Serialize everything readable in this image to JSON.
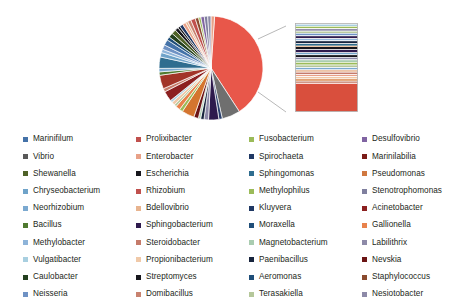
{
  "chart_data": {
    "type": "pie",
    "title": "",
    "subtitle": "",
    "xlabel": "",
    "ylabel": "",
    "legend_position": "bottom",
    "grid": false,
    "has_magnified_inset": true,
    "inset_type": "stacked-bar",
    "inset_description": "Magnified stacked bar expanding the dominant Prolixibacter slice and adjacent thin slices",
    "categories": [
      "Marinifilum",
      "Prolixibacter",
      "Fusobacterium",
      "Desulfovibrio",
      "Vibrio",
      "Enterobacter",
      "Spirochaeta",
      "Marinilabilia",
      "Shewanella",
      "Escherichia",
      "Sphingomonas",
      "Pseudomonas",
      "Chryseobacterium",
      "Rhizobium",
      "Methylophilus",
      "Stenotrophomonas",
      "Neorhizobium",
      "Bdellovibrio",
      "Kluyvera",
      "Acinetobacter",
      "Bacillus",
      "Sphingobacterium",
      "Moraxella",
      "Gallionella",
      "Methylobacter",
      "Steroidobacter",
      "Magnetobacterium",
      "Labilithrix",
      "Vulgatibacter",
      "Propionibacterium",
      "Paenibacillus",
      "Nevskia",
      "Caulobacter",
      "Streptomyces",
      "Aeromonas",
      "Staphylococcus",
      "Neisseria",
      "Domibacillus",
      "Terasakiella",
      "Nesiotobacter"
    ],
    "values": [
      2.4,
      36.0,
      1.0,
      1.2,
      2.0,
      1.3,
      1.1,
      3.6,
      1.8,
      1.0,
      1.5,
      2.6,
      1.4,
      3.2,
      1.2,
      1.1,
      1.3,
      1.6,
      0.9,
      2.2,
      1.5,
      1.0,
      1.1,
      1.4,
      1.2,
      1.3,
      1.0,
      0.9,
      1.1,
      1.6,
      1.0,
      0.9,
      0.8,
      1.0,
      1.1,
      0.9,
      1.0,
      1.2,
      0.9,
      1.4
    ],
    "units": "percent relative abundance"
  },
  "legend": {
    "columns": 4,
    "rows": 10,
    "items": [
      {
        "label": "Marinifilum",
        "color": "#4472a8"
      },
      {
        "label": "Prolixibacter",
        "color": "#c0504d"
      },
      {
        "label": "Fusobacterium",
        "color": "#9bbb59"
      },
      {
        "label": "Desulfovibrio",
        "color": "#8064a2"
      },
      {
        "label": "Vibrio",
        "color": "#595959"
      },
      {
        "label": "Enterobacter",
        "color": "#e8a188"
      },
      {
        "label": "Spirochaeta",
        "color": "#1f3864"
      },
      {
        "label": "Marinilabilia",
        "color": "#7b1c18"
      },
      {
        "label": "Shewanella",
        "color": "#4f6228"
      },
      {
        "label": "Escherichia",
        "color": "#17161c"
      },
      {
        "label": "Sphingomonas",
        "color": "#2f6d8f"
      },
      {
        "label": "Pseudomonas",
        "color": "#d07840"
      },
      {
        "label": "Chryseobacterium",
        "color": "#6fa3c9"
      },
      {
        "label": "Rhizobium",
        "color": "#c0504d"
      },
      {
        "label": "Methylophilus",
        "color": "#9bbb59"
      },
      {
        "label": "Stenotrophomonas",
        "color": "#7f7f9e"
      },
      {
        "label": "Neorhizobium",
        "color": "#7ba9d0"
      },
      {
        "label": "Bdellovibrio",
        "color": "#e8b48f"
      },
      {
        "label": "Kluyvera",
        "color": "#1f3864"
      },
      {
        "label": "Acinetobacter",
        "color": "#8c2020"
      },
      {
        "label": "Bacillus",
        "color": "#4f7a2f"
      },
      {
        "label": "Sphingobacterium",
        "color": "#2e1a4d"
      },
      {
        "label": "Moraxella",
        "color": "#1f4e79"
      },
      {
        "label": "Gallionella",
        "color": "#e8824c"
      },
      {
        "label": "Methylobacter",
        "color": "#8eb4d9"
      },
      {
        "label": "Steroidobacter",
        "color": "#c57b6a"
      },
      {
        "label": "Magnetobacterium",
        "color": "#a9ccb0"
      },
      {
        "label": "Labilithrix",
        "color": "#8d8aa8"
      },
      {
        "label": "Vulgatibacter",
        "color": "#a8cfe0"
      },
      {
        "label": "Propionibacterium",
        "color": "#f0c9a8"
      },
      {
        "label": "Paenibacillus",
        "color": "#17243d"
      },
      {
        "label": "Nevskia",
        "color": "#6b1414"
      },
      {
        "label": "Caulobacter",
        "color": "#24401f"
      },
      {
        "label": "Streptomyces",
        "color": "#17161c"
      },
      {
        "label": "Aeromonas",
        "color": "#1f4e79"
      },
      {
        "label": "Staphylococcus",
        "color": "#8a4a2e"
      },
      {
        "label": "Neisseria",
        "color": "#6f92c4"
      },
      {
        "label": "Domibacillus",
        "color": "#c8826f"
      },
      {
        "label": "Terasakiella",
        "color": "#b5c79a"
      },
      {
        "label": "Nesiotobacter",
        "color": "#8d8aa8"
      }
    ]
  },
  "pie": {
    "center_x": 56,
    "center_y": 52,
    "radius": 52,
    "start_angle_deg": -86,
    "slices": [
      {
        "label": "Prolixibacter",
        "sweep": 112,
        "color": "#e8574a"
      },
      {
        "label": "Vibrio",
        "sweep": 16,
        "color": "#6f6f6f"
      },
      {
        "label": "Spirochaeta",
        "sweep": 3,
        "color": "#2a3f6b"
      },
      {
        "label": "Sphingobacterium",
        "sweep": 9,
        "color": "#2e1a4d"
      },
      {
        "label": "Labilithrix",
        "sweep": 4,
        "color": "#8d8aa8"
      },
      {
        "label": "Paenibacillus",
        "sweep": 3,
        "color": "#17243d"
      },
      {
        "label": "Magnetobacterium",
        "sweep": 2,
        "color": "#a9ccb0"
      },
      {
        "label": "Nevskia",
        "sweep": 4,
        "color": "#6b1414"
      },
      {
        "label": "Pseudomonas",
        "sweep": 11,
        "color": "#d4752f"
      },
      {
        "label": "Methylophilus",
        "sweep": 3,
        "color": "#9bbb59"
      },
      {
        "label": "Gallionella",
        "sweep": 4,
        "color": "#e8824c"
      },
      {
        "label": "Terasakiella",
        "sweep": 2,
        "color": "#b5c79a"
      },
      {
        "label": "Propionibacterium",
        "sweep": 3,
        "color": "#f0c9a8"
      },
      {
        "label": "Vulgatibacter",
        "sweep": 2,
        "color": "#a8cfe0"
      },
      {
        "label": "Acinetobacter",
        "sweep": 9,
        "color": "#8c2020"
      },
      {
        "label": "Steroidobacter",
        "sweep": 3,
        "color": "#c57b6a"
      },
      {
        "label": "Marinilabilia",
        "sweep": 12,
        "color": "#a23428"
      },
      {
        "label": "Bacillus",
        "sweep": 3,
        "color": "#4f7a2f"
      },
      {
        "label": "Neorhizobium",
        "sweep": 3,
        "color": "#7ba9d0"
      },
      {
        "label": "Sphingomonas",
        "sweep": 10,
        "color": "#2f6d8f"
      },
      {
        "label": "Chryseobacterium",
        "sweep": 4,
        "color": "#6fa3c9"
      },
      {
        "label": "Methylobacter",
        "sweep": 3,
        "color": "#8eb4d9"
      },
      {
        "label": "Neisseria",
        "sweep": 4,
        "color": "#6f92c4"
      },
      {
        "label": "Marinifilum",
        "sweep": 5,
        "color": "#4472a8"
      },
      {
        "label": "Moraxella",
        "sweep": 3,
        "color": "#1f4e79"
      },
      {
        "label": "Caulobacter",
        "sweep": 4,
        "color": "#24401f"
      },
      {
        "label": "Shewanella",
        "sweep": 4,
        "color": "#4f6228"
      },
      {
        "label": "Escherichia",
        "sweep": 3,
        "color": "#17161c"
      },
      {
        "label": "Streptomyces",
        "sweep": 2,
        "color": "#17161c"
      },
      {
        "label": "Kluyvera",
        "sweep": 3,
        "color": "#1f3864"
      },
      {
        "label": "Enterobacter",
        "sweep": 3,
        "color": "#e8a188"
      },
      {
        "label": "Bdellovibrio",
        "sweep": 2,
        "color": "#e8b48f"
      },
      {
        "label": "Domibacillus",
        "sweep": 3,
        "color": "#c8826f"
      },
      {
        "label": "Rhizobium",
        "sweep": 4,
        "color": "#c0504d"
      },
      {
        "label": "Staphylococcus",
        "sweep": 3,
        "color": "#8a4a2e"
      },
      {
        "label": "Fusobacterium",
        "sweep": 2,
        "color": "#9bbb59"
      },
      {
        "label": "Desulfovibrio",
        "sweep": 3,
        "color": "#8064a2"
      },
      {
        "label": "Stenotrophomonas",
        "sweep": 3,
        "color": "#7f7f9e"
      },
      {
        "label": "Nesiotobacter",
        "sweep": 3,
        "color": "#8d8aa8"
      },
      {
        "label": "Enterobacter2",
        "sweep": 3,
        "color": "#e8a188"
      }
    ]
  },
  "callout": {
    "width": 62,
    "height": 88,
    "border_color": "#b0b0b0",
    "bands": [
      {
        "color": "#ffffff",
        "h": 1.2
      },
      {
        "color": "#a8cfe0",
        "h": 1.6
      },
      {
        "color": "#ffffff",
        "h": 0.8
      },
      {
        "color": "#9bbb59",
        "h": 1.8
      },
      {
        "color": "#ffffff",
        "h": 0.8
      },
      {
        "color": "#8d8aa8",
        "h": 2.0
      },
      {
        "color": "#ffffff",
        "h": 0.8
      },
      {
        "color": "#b5c79a",
        "h": 1.6
      },
      {
        "color": "#ffffff",
        "h": 0.8
      },
      {
        "color": "#6f92c4",
        "h": 2.0
      },
      {
        "color": "#ffffff",
        "h": 0.8
      },
      {
        "color": "#2e1a4d",
        "h": 2.4
      },
      {
        "color": "#ffffff",
        "h": 0.8
      },
      {
        "color": "#8eb4d9",
        "h": 1.6
      },
      {
        "color": "#ffffff",
        "h": 0.8
      },
      {
        "color": "#17243d",
        "h": 2.4
      },
      {
        "color": "#ffffff",
        "h": 0.7
      },
      {
        "color": "#2f6d8f",
        "h": 2.0
      },
      {
        "color": "#f0c9a8",
        "h": 1.4
      },
      {
        "color": "#17161c",
        "h": 2.6
      },
      {
        "color": "#ffffff",
        "h": 0.7
      },
      {
        "color": "#2e1a4d",
        "h": 2.8
      },
      {
        "color": "#ffffff",
        "h": 0.7
      },
      {
        "color": "#6fa3c9",
        "h": 1.6
      },
      {
        "color": "#ffffff",
        "h": 0.7
      },
      {
        "color": "#17161c",
        "h": 2.2
      },
      {
        "color": "#ffffff",
        "h": 0.7
      },
      {
        "color": "#8d8aa8",
        "h": 2.0
      },
      {
        "color": "#ffffff",
        "h": 0.8
      },
      {
        "color": "#a9ccb0",
        "h": 2.0
      },
      {
        "color": "#ffffff",
        "h": 0.8
      },
      {
        "color": "#9bbb59",
        "h": 2.2
      },
      {
        "color": "#ffffff",
        "h": 0.8
      },
      {
        "color": "#b5c79a",
        "h": 2.0
      },
      {
        "color": "#ffffff",
        "h": 0.8
      },
      {
        "color": "#7ba9d0",
        "h": 1.8
      },
      {
        "color": "#ffffff",
        "h": 0.8
      },
      {
        "color": "#e8b48f",
        "h": 1.8
      },
      {
        "color": "#ffffff",
        "h": 0.8
      },
      {
        "color": "#c57b6a",
        "h": 1.8
      },
      {
        "color": "#ffffff",
        "h": 0.8
      },
      {
        "color": "#e8a188",
        "h": 1.6
      },
      {
        "color": "#ffffff",
        "h": 0.8
      },
      {
        "color": "#f0c9a8",
        "h": 1.8
      },
      {
        "color": "#ffffff",
        "h": 0.8
      },
      {
        "color": "#d4752f",
        "h": 1.6
      },
      {
        "color": "#ffffff",
        "h": 0.8
      },
      {
        "color": "#c8826f",
        "h": 1.6
      },
      {
        "color": "#ffffff",
        "h": 1.0
      },
      {
        "color": "#d94f3d",
        "h": 31.0
      }
    ]
  },
  "leaders": {
    "color": "#9a9a9a",
    "lines": [
      {
        "x1": 108,
        "y1": 27,
        "x2": 136,
        "y2": 14
      },
      {
        "x1": 108,
        "y1": 80,
        "x2": 136,
        "y2": 100
      }
    ]
  }
}
